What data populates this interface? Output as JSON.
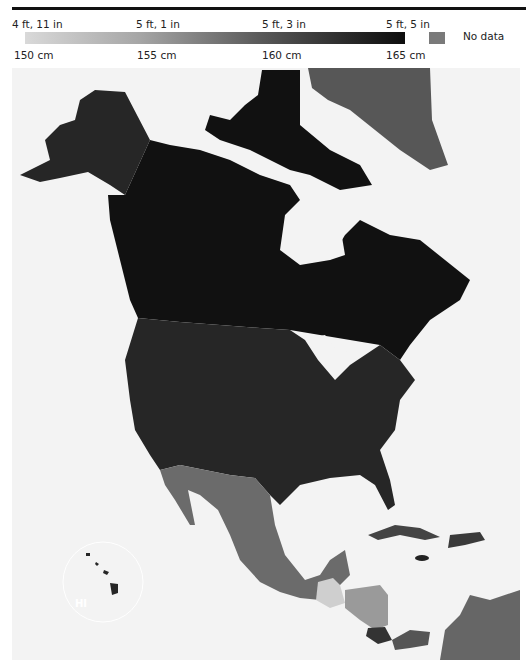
{
  "legend": {
    "top_ticks": [
      {
        "label": "4 ft, 11 in",
        "x": 12
      },
      {
        "label": "5 ft, 1 in",
        "x": 136
      },
      {
        "label": "5 ft, 3 in",
        "x": 262
      },
      {
        "label": "5 ft, 5 in",
        "x": 386
      }
    ],
    "bottom_ticks": [
      {
        "label": "150 cm",
        "x": 14
      },
      {
        "label": "155 cm",
        "x": 137
      },
      {
        "label": "160 cm",
        "x": 262
      },
      {
        "label": "165 cm",
        "x": 386
      }
    ],
    "no_data_label": "No data",
    "scale_min_cm": 150,
    "scale_max_cm": 165,
    "no_data_color": "#7a7a7a"
  },
  "map": {
    "inset_label": "HI",
    "regions": [
      {
        "name": "Canada",
        "color": "#111111"
      },
      {
        "name": "United States",
        "color": "#262626"
      },
      {
        "name": "Alaska",
        "color": "#262626"
      },
      {
        "name": "Greenland",
        "color": "#575757"
      },
      {
        "name": "Mexico",
        "color": "#6b6b6b"
      },
      {
        "name": "Guatemala",
        "color": "#cfcfcf"
      },
      {
        "name": "Belize",
        "color": "#6b6b6b"
      },
      {
        "name": "Honduras",
        "color": "#9a9a9a"
      },
      {
        "name": "Nicaragua",
        "color": "#9a9a9a"
      },
      {
        "name": "El Salvador",
        "color": "#6b6b6b"
      },
      {
        "name": "Costa Rica",
        "color": "#333333"
      },
      {
        "name": "Panama",
        "color": "#555555"
      },
      {
        "name": "Colombia",
        "color": "#666666"
      },
      {
        "name": "Venezuela",
        "color": "#666666"
      },
      {
        "name": "Cuba",
        "color": "#444444"
      },
      {
        "name": "Jamaica",
        "color": "#222222"
      },
      {
        "name": "Hispaniola",
        "color": "#3a3a3a"
      },
      {
        "name": "Hawaii",
        "color": "#262626"
      }
    ]
  }
}
